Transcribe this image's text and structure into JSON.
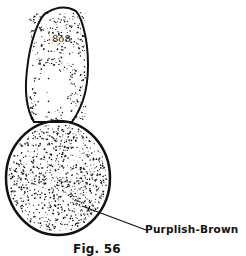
{
  "figure": {
    "caption": "Fig. 56",
    "parts": [
      {
        "name": "cephalothorax",
        "texture": "stippled",
        "eye_marks": "8ö8"
      },
      {
        "name": "abdomen",
        "texture": "densely stippled"
      }
    ],
    "callouts": [
      {
        "text": "Purplish-Brown",
        "target": "abdomen"
      }
    ],
    "ink_color": "#111111",
    "background_color": "#ffffff"
  }
}
